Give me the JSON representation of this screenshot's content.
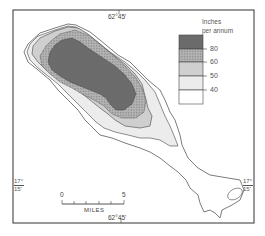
{
  "map": {
    "title": "",
    "top_longitude_label": "62°45'",
    "bottom_longitude_label": "62°45'",
    "left_latitude_label": {
      "deg": "17°",
      "min": "15'"
    },
    "right_latitude_label": {
      "deg": "17°",
      "min": "15'"
    },
    "scale_bar": {
      "start": "0",
      "end": "5",
      "unit": "MILES"
    },
    "legend": {
      "title_line1": "Inches",
      "title_line2": "per annum",
      "classes": [
        {
          "label": "80",
          "color": "#6e6e6e",
          "range": ">80"
        },
        {
          "label": "60",
          "color": "#a5a5a5",
          "range": "60-80"
        },
        {
          "label": "50",
          "color": "#cfcfcf",
          "range": "50-60"
        },
        {
          "label": "40",
          "color": "#ececec",
          "range": "40-50"
        },
        {
          "label": "",
          "color": "#ffffff",
          "range": "<40"
        }
      ]
    }
  }
}
